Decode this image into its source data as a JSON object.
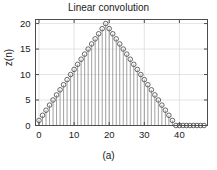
{
  "figure": {
    "title": "Linear convolution",
    "caption": "(a)",
    "ylabel": "z(n)"
  },
  "chart_data": {
    "type": "line",
    "plot_style": "stem",
    "title": "Linear convolution",
    "subtitle": "(a)",
    "xlabel": "",
    "ylabel": "z(n)",
    "xlim": [
      -1,
      48
    ],
    "ylim": [
      0,
      20.8
    ],
    "xticks": [
      0,
      10,
      20,
      30,
      40
    ],
    "yticks": [
      0,
      5,
      10,
      15,
      20
    ],
    "grid": true,
    "legend": null,
    "marker": "open-circle",
    "colors": {
      "marker_edge": "#4d4d4d",
      "stem_line": "#808080",
      "axis": "#4d4d4d",
      "grid": "#d9d9d9",
      "text": "#1a1a1a",
      "background": "#ffffff"
    },
    "x": [
      0,
      1,
      2,
      3,
      4,
      5,
      6,
      7,
      8,
      9,
      10,
      11,
      12,
      13,
      14,
      15,
      16,
      17,
      18,
      19,
      20,
      21,
      22,
      23,
      24,
      25,
      26,
      27,
      28,
      29,
      30,
      31,
      32,
      33,
      34,
      35,
      36,
      37,
      38,
      39,
      40,
      41,
      42,
      43,
      44,
      45,
      46,
      47
    ],
    "values": [
      0.5,
      1.0,
      1.5,
      2.0,
      2.5,
      3.0,
      3.5,
      4.0,
      4.5,
      5.0,
      5.5,
      6.0,
      6.5,
      7.0,
      7.5,
      8.0,
      8.5,
      9.0,
      9.5,
      10.0,
      9.5,
      9.0,
      8.5,
      8.0,
      7.5,
      7.0,
      6.5,
      6.0,
      5.5,
      5.0,
      4.5,
      4.0,
      3.5,
      3.0,
      2.5,
      2.0,
      1.5,
      1.0,
      0.5,
      0,
      0,
      0,
      0,
      0,
      0,
      0,
      0,
      0
    ],
    "values_scaled": [
      1.0,
      2.0,
      3.0,
      4.0,
      5.0,
      6.0,
      7.0,
      8.0,
      9.0,
      10.0,
      11.0,
      12.0,
      13.0,
      14.0,
      15.0,
      16.0,
      17.0,
      18.0,
      19.0,
      20.0,
      19.0,
      18.0,
      17.0,
      16.0,
      15.0,
      14.0,
      13.0,
      12.0,
      11.0,
      10.0,
      9.0,
      8.0,
      7.0,
      6.0,
      5.0,
      4.0,
      3.0,
      2.0,
      1.0,
      0,
      0,
      0,
      0,
      0,
      0,
      0,
      0,
      0
    ],
    "peak_x": 19,
    "peak_y": 20
  }
}
